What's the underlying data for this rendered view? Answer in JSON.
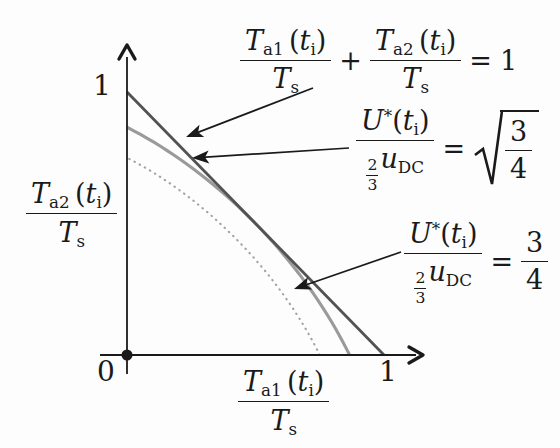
{
  "axes": {
    "x_label": {
      "num": "T_{a1} (t_{i})",
      "den": "T_{s}"
    },
    "y_label": {
      "num": "T_{a2} (t_{i})",
      "den": "T_{s}"
    },
    "x_tick": "1",
    "y_tick": "1",
    "origin": "0"
  },
  "equations": {
    "constraint": {
      "f1_num": "T_{a1} (t_{i})",
      "f1_den": "T_{s}",
      "op": "+",
      "f2_num": "T_{a2} (t_{i})",
      "f2_den": "T_{s}",
      "rel": "=",
      "rhs": "1"
    },
    "sqrt34": {
      "num": "U^{*}(t_{i})",
      "den": "\\f{2}{3}u_{DC}",
      "rel": "=",
      "root_num": "3",
      "root_den": "4"
    },
    "frac34": {
      "num": "U^{*}(t_{i})",
      "den": "\\f{2}{3}u_{DC}",
      "rel": "=",
      "rhs_num": "3",
      "rhs_den": "4"
    }
  },
  "chart_data": {
    "type": "line",
    "title": "",
    "xlabel": "T_a1(t_i)/T_s",
    "ylabel": "T_a2(t_i)/T_s",
    "xlim": [
      0,
      1.15
    ],
    "ylim": [
      0,
      1.18
    ],
    "grid": false,
    "legend_position": "none",
    "series": [
      {
        "id": "constraint-line",
        "name": "T_a1(t_i)/T_s + T_a2(t_i)/T_s = 1",
        "type": "segment",
        "points": [
          [
            0,
            1
          ],
          [
            1,
            0
          ]
        ],
        "color": "#525252",
        "width": 2.8,
        "dash": "solid"
      },
      {
        "id": "sqrt34-curve",
        "name": "U*(t_i)/((2/3)u_DC) = sqrt(3/4)",
        "type": "svm_ellipse",
        "equation": "a²+ab+b²=m²",
        "m": 0.8660254,
        "intercepts": [
          [
            0,
            0.866
          ],
          [
            0.866,
            0
          ]
        ],
        "tangent_point": [
          0.5,
          0.5
        ],
        "color": "#9a9a9a",
        "width": 3.1,
        "dash": "solid"
      },
      {
        "id": "frac34-curve",
        "name": "U*(t_i)/((2/3)u_DC) = 3/4",
        "type": "svm_ellipse",
        "equation": "a²+ab+b²=m²",
        "m": 0.75,
        "intercepts": [
          [
            0,
            0.75
          ],
          [
            0.75,
            0
          ]
        ],
        "color": "#a3a3a3",
        "width": 2.1,
        "dash": "dotted"
      }
    ],
    "annotations": [
      {
        "target": "constraint-line",
        "from_px": [
          313,
          88
        ],
        "to_px": [
          186,
          137
        ]
      },
      {
        "target": "sqrt34-curve",
        "from_px": [
          349,
          148
        ],
        "to_px": [
          192,
          158
        ]
      },
      {
        "target": "frac34-curve",
        "from_px": [
          401,
          252
        ],
        "to_px": [
          294,
          289
        ]
      }
    ],
    "colors": {
      "axis": "#1a1a1a",
      "arrow": "#1a1a1a"
    }
  }
}
